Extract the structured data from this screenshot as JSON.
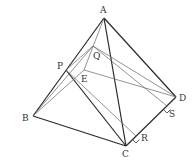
{
  "diagram": {
    "type": "tetrahedron-geometry",
    "points": {
      "A": {
        "label": "A",
        "x": 104,
        "y": 18,
        "lx": 100,
        "ly": 13
      },
      "B": {
        "label": "B",
        "x": 33,
        "y": 116,
        "lx": 22,
        "ly": 121
      },
      "C": {
        "label": "C",
        "x": 126,
        "y": 146,
        "lx": 122,
        "ly": 157
      },
      "D": {
        "label": "D",
        "x": 176,
        "y": 97,
        "lx": 179,
        "ly": 101
      },
      "P": {
        "label": "P",
        "x": 66,
        "y": 70,
        "lx": 57,
        "ly": 69
      },
      "Q": {
        "label": "Q",
        "x": 93,
        "y": 46,
        "lx": 93,
        "ly": 59
      },
      "E": {
        "label": "E",
        "x": 84,
        "y": 70,
        "lx": 81,
        "ly": 82
      },
      "R": {
        "label": "R",
        "x": 136,
        "y": 136,
        "lx": 141,
        "ly": 141
      },
      "S": {
        "label": "S",
        "x": 167,
        "y": 106,
        "lx": 169,
        "ly": 117
      }
    },
    "edges": [
      {
        "from": "A",
        "to": "B",
        "style": "thick"
      },
      {
        "from": "A",
        "to": "C",
        "style": "thick"
      },
      {
        "from": "A",
        "to": "D",
        "style": "thick"
      },
      {
        "from": "B",
        "to": "C",
        "style": "thick"
      },
      {
        "from": "C",
        "to": "D",
        "style": "thick"
      },
      {
        "from": "P",
        "to": "C",
        "style": "thick"
      },
      {
        "from": "A",
        "to": "E",
        "style": "thin"
      },
      {
        "from": "B",
        "to": "E",
        "style": "thin"
      },
      {
        "from": "E",
        "to": "D",
        "style": "thin"
      },
      {
        "from": "P",
        "to": "Q",
        "style": "thin"
      },
      {
        "from": "Q",
        "to": "D",
        "style": "thin"
      },
      {
        "from": "Q",
        "to": "S",
        "style": "thin"
      },
      {
        "from": "P",
        "to": "R",
        "style": "thin"
      },
      {
        "from": "B",
        "to": "Q",
        "style": "thin"
      }
    ],
    "right_angles": [
      "R",
      "S"
    ]
  }
}
